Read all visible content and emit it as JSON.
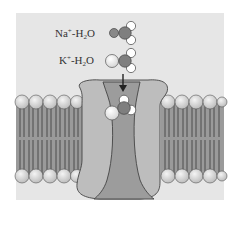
{
  "figure": {
    "labels": {
      "na": {
        "ion": "Na",
        "charge": "+",
        "rest": "-H",
        "sub": "2",
        "tail": "O"
      },
      "k": {
        "ion": "K",
        "charge": "+",
        "rest": "-H",
        "sub": "2",
        "tail": "O"
      }
    },
    "colors": {
      "panel_bg": "#e6e6e6",
      "membrane_tail": "#9a9a9a",
      "membrane_tail_line": "#444444",
      "head": "#d8d8d8",
      "protein": "#bdbdbd",
      "pore": "#9c9c9c",
      "oxygen": "#7f7f7f",
      "hydrogen": "#ffffff",
      "na_ion": "#888888",
      "k_ion": "#eeeeee",
      "outline": "#444444",
      "arrow": "#222222"
    },
    "components": [
      "lipid-bilayer-left",
      "lipid-bilayer-right",
      "channel-protein",
      "pore",
      "arrow",
      "na-water-complex",
      "k-water-complex",
      "k-ion-in-pore"
    ]
  }
}
